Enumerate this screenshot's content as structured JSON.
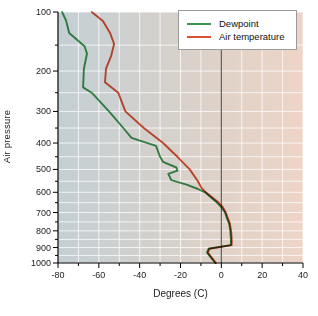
{
  "figure": {
    "width": 318,
    "height": 316,
    "background": "#ffffff"
  },
  "chart_data": {
    "type": "line",
    "title": "",
    "xlabel": "Degrees (C)",
    "ylabel": "Air pressure",
    "xlim": [
      -80,
      40
    ],
    "x_major_ticks": [
      -80,
      -60,
      -40,
      -20,
      0,
      20,
      40
    ],
    "x_minor_step": 10,
    "y_scale": "pressure (power 0.286, inverted)",
    "ylim": [
      100,
      1000
    ],
    "y_major_ticks": [
      100,
      200,
      300,
      400,
      500,
      600,
      700,
      800,
      900,
      1000
    ],
    "y_minor_step": 50,
    "zero_reference_line_x": 0,
    "grid": true,
    "legend_position": "top-right",
    "series": [
      {
        "name": "Dewpoint",
        "color": "#3e9351",
        "points_t_p": [
          [
            -78,
            100
          ],
          [
            -76,
            112
          ],
          [
            -74.5,
            130
          ],
          [
            -67,
            152
          ],
          [
            -65.8,
            165
          ],
          [
            -67.3,
            195
          ],
          [
            -67.7,
            237
          ],
          [
            -63.5,
            250
          ],
          [
            -55,
            300
          ],
          [
            -48,
            350
          ],
          [
            -44,
            382
          ],
          [
            -32,
            410
          ],
          [
            -30,
            450
          ],
          [
            -28.5,
            470
          ],
          [
            -22,
            492
          ],
          [
            -21.5,
            505
          ],
          [
            -26,
            518
          ],
          [
            -24.5,
            545
          ],
          [
            -17,
            565
          ],
          [
            -11.5,
            585
          ],
          [
            -8,
            600
          ],
          [
            -2.6,
            645
          ],
          [
            0,
            672
          ],
          [
            1.8,
            700
          ],
          [
            2.6,
            725
          ],
          [
            3.8,
            760
          ],
          [
            4.4,
            800
          ],
          [
            4.7,
            850
          ],
          [
            4.7,
            885
          ],
          [
            -6.3,
            908
          ],
          [
            -7,
            932
          ],
          [
            -3,
            1000
          ]
        ]
      },
      {
        "name": "Air temperature",
        "color": "#d95236",
        "points_t_p": [
          [
            -63.5,
            100
          ],
          [
            -58,
            112
          ],
          [
            -54.5,
            130
          ],
          [
            -52.5,
            148
          ],
          [
            -54,
            170
          ],
          [
            -56.5,
            195
          ],
          [
            -57,
            225
          ],
          [
            -50.5,
            250
          ],
          [
            -47,
            300
          ],
          [
            -38,
            350
          ],
          [
            -28.5,
            400
          ],
          [
            -21.5,
            450
          ],
          [
            -15.5,
            500
          ],
          [
            -11.5,
            550
          ],
          [
            -9.7,
            580
          ],
          [
            -7.6,
            600
          ],
          [
            -1.8,
            645
          ],
          [
            0.7,
            672
          ],
          [
            2.2,
            700
          ],
          [
            3,
            725
          ],
          [
            4.2,
            760
          ],
          [
            4.8,
            800
          ],
          [
            5.1,
            850
          ],
          [
            5.1,
            885
          ],
          [
            -5.9,
            908
          ],
          [
            -6.6,
            932
          ],
          [
            -2.6,
            1000
          ]
        ]
      }
    ],
    "plot_background_gradient": [
      "#c3cfd5",
      "#d8d1ca",
      "#eed4c6"
    ],
    "grid_color": "#ffffff",
    "zero_line_color": "#5c5c60",
    "axis_color": "#000000",
    "tick_label_color": "#1c1c1c"
  }
}
